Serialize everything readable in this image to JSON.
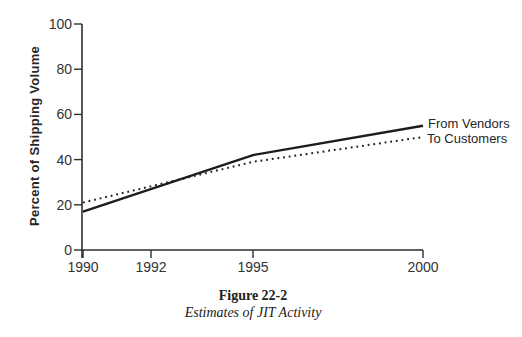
{
  "chart_data": {
    "type": "line",
    "title": "",
    "ylabel": "Percent of Shipping Volume",
    "xlabel": "",
    "x": [
      1990,
      1995,
      2000
    ],
    "x_ticks": [
      1990,
      1992,
      1995,
      2000
    ],
    "y_ticks": [
      0,
      20,
      40,
      60,
      80,
      100
    ],
    "xlim": [
      1990,
      2000
    ],
    "ylim": [
      0,
      100
    ],
    "grid": false,
    "legend_position": "line-end-labels",
    "series": [
      {
        "name": "From Vendors",
        "style": "solid",
        "values": [
          17,
          42,
          55
        ]
      },
      {
        "name": "To Customers",
        "style": "dotted",
        "values": [
          21,
          39,
          50
        ]
      }
    ]
  },
  "caption": {
    "figure_label": "Figure 22-2",
    "figure_title": "Estimates of JIT Activity"
  },
  "colors": {
    "line": "#1d1d1d",
    "axis": "#2e2e2e",
    "text": "#333333",
    "background": "#ffffff"
  }
}
